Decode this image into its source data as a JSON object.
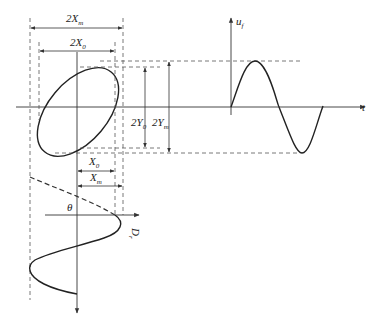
{
  "figure": {
    "labels": {
      "two_xm": "2X",
      "two_xm_sub": "m",
      "two_x0": "2X",
      "two_x0_sub": "0",
      "two_y0": "2Y",
      "two_y0_sub": "0",
      "two_ym": "2Y",
      "two_ym_sub": "m",
      "x0": "X",
      "x0_sub": "0",
      "xm": "X",
      "xm_sub": "m",
      "theta": "θ",
      "uf": "u",
      "uf_sub": "f",
      "t": "t",
      "dr": "D",
      "dr_sub": "r"
    },
    "colors": {
      "curve": "#222222",
      "dashed": "#555555",
      "background": "#ffffff"
    }
  }
}
